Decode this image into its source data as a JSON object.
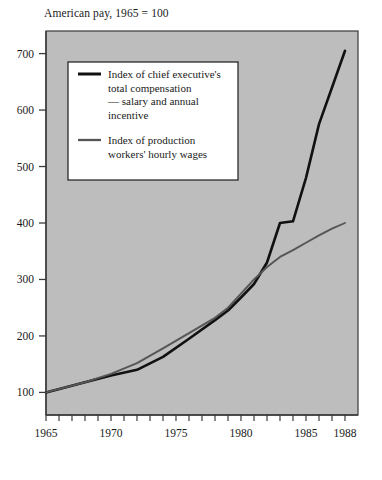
{
  "chart_data": {
    "type": "line",
    "title": "American pay, 1965 = 100",
    "xlabel": "",
    "ylabel": "",
    "xlim": [
      1965,
      1989
    ],
    "ylim": [
      60,
      740
    ],
    "yticks": [
      100,
      200,
      300,
      400,
      500,
      600,
      700
    ],
    "ytick_labels": [
      "100",
      "200",
      "300",
      "400",
      "500",
      "600",
      "700"
    ],
    "xticks": [
      1965,
      1970,
      1975,
      1980,
      1985,
      1988
    ],
    "xtick_labels": [
      "1965",
      "1970",
      "1975",
      "1980",
      "1985",
      "1988"
    ],
    "minor_xticks": [
      1965,
      1966,
      1967,
      1968,
      1969,
      1970,
      1971,
      1972,
      1973,
      1974,
      1975,
      1976,
      1977,
      1978,
      1979,
      1980,
      1981,
      1982,
      1983,
      1984,
      1985,
      1986,
      1987,
      1988
    ],
    "grid": false,
    "legend_position": "upper-left-inside",
    "plot_background": "#bdbdbd",
    "series": [
      {
        "name": "Index of chief executive's total compensation — salary and annual incentive",
        "color": "#111111",
        "width": 2.6,
        "x": [
          1965,
          1968,
          1970,
          1972,
          1974,
          1976,
          1978,
          1979,
          1980,
          1981,
          1982,
          1983,
          1984,
          1985,
          1986,
          1987,
          1988
        ],
        "values": [
          100,
          118,
          130,
          140,
          163,
          195,
          228,
          245,
          268,
          292,
          330,
          400,
          403,
          480,
          575,
          640,
          705
        ]
      },
      {
        "name": "Index of production workers' hourly wages",
        "color": "#555555",
        "width": 1.9,
        "x": [
          1965,
          1968,
          1970,
          1972,
          1974,
          1976,
          1978,
          1979,
          1980,
          1981,
          1982,
          1983,
          1984,
          1985,
          1986,
          1987,
          1988
        ],
        "values": [
          100,
          118,
          133,
          152,
          178,
          205,
          232,
          250,
          275,
          300,
          322,
          340,
          352,
          365,
          378,
          390,
          400
        ]
      }
    ]
  },
  "legend": {
    "entries": [
      {
        "swatch": "black-line-swatch",
        "lines": [
          "Index of chief executive's",
          "total compensation",
          "— salary and annual",
          "incentive"
        ]
      },
      {
        "swatch": "gray-line-swatch",
        "lines": [
          "Index of production",
          "workers' hourly wages"
        ]
      }
    ]
  },
  "colors": {
    "plot_background": "#bdbdbd",
    "axis": "#3a3a3a",
    "executive_line": "#111111",
    "worker_line": "#555555",
    "legend_background": "#ffffff",
    "legend_border": "#2a2a2a",
    "text": "#1a1a1a"
  }
}
